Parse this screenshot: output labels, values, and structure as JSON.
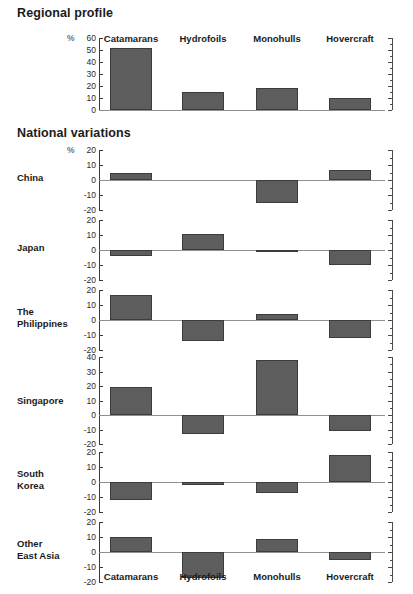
{
  "sections": {
    "regional_title": "Regional profile",
    "national_title": "National variations"
  },
  "axis": {
    "percent_symbol": "%"
  },
  "chart_data": {
    "type": "bar",
    "categories": [
      "Catamarans",
      "Hydrofoils",
      "Monohulls",
      "Hovercraft"
    ],
    "xlabel": "",
    "ylabel": "%",
    "grid": false,
    "legend": "none",
    "panels": [
      {
        "name": "Regional profile",
        "label": "",
        "ylabel": "%",
        "ylim": [
          0,
          60
        ],
        "yticks": [
          0,
          10,
          20,
          30,
          40,
          50,
          60
        ],
        "ticklabels": [
          "0",
          "10",
          "20",
          "30",
          "40",
          "50",
          "60"
        ],
        "values": [
          52,
          15,
          18,
          10
        ]
      },
      {
        "name": "China",
        "label": "China",
        "ylabel": "%",
        "ylim": [
          -20,
          20
        ],
        "yticks": [
          -20,
          -10,
          0,
          10,
          20
        ],
        "ticklabels": [
          "-20",
          "-10",
          "0",
          "10",
          "20"
        ],
        "values": [
          5,
          0,
          -15,
          7
        ]
      },
      {
        "name": "Japan",
        "label": "Japan",
        "ylabel": "",
        "ylim": [
          -20,
          20
        ],
        "yticks": [
          -20,
          -10,
          0,
          10,
          20
        ],
        "ticklabels": [
          "-20",
          "-10",
          "0",
          "10",
          "20"
        ],
        "values": [
          -4,
          11,
          -1,
          -10
        ]
      },
      {
        "name": "The Philippines",
        "label": "The\nPhilippines",
        "ylabel": "",
        "ylim": [
          -20,
          20
        ],
        "yticks": [
          -20,
          -10,
          0,
          10,
          20
        ],
        "ticklabels": [
          "-20",
          "-10",
          "0",
          "10",
          "20"
        ],
        "values": [
          17,
          -14,
          4,
          -12
        ]
      },
      {
        "name": "Singapore",
        "label": "Singapore",
        "ylabel": "",
        "ylim": [
          -20,
          40
        ],
        "yticks": [
          -20,
          -10,
          0,
          10,
          20,
          30,
          40
        ],
        "ticklabels": [
          "-20",
          "-10",
          "0",
          "10",
          "20",
          "30",
          "40"
        ],
        "values": [
          19,
          -13,
          38,
          -11
        ]
      },
      {
        "name": "South Korea",
        "label": "South\nKorea",
        "ylabel": "",
        "ylim": [
          -20,
          20
        ],
        "yticks": [
          -20,
          -10,
          0,
          10,
          20
        ],
        "ticklabels": [
          "-20",
          "-10",
          "0",
          "10",
          "20"
        ],
        "values": [
          -12,
          -2,
          -7,
          18
        ]
      },
      {
        "name": "Other East Asia",
        "label": "Other\nEast Asia",
        "ylabel": "",
        "ylim": [
          -20,
          20
        ],
        "yticks": [
          -20,
          -10,
          0,
          10,
          20
        ],
        "ticklabels": [
          "-20",
          "-10",
          "0",
          "10",
          "20"
        ],
        "values": [
          10,
          -17,
          9,
          -5
        ]
      }
    ],
    "colors": {
      "bar_fill": "#5d5d5d",
      "bar_stroke": "#3c3c3c",
      "axis": "#3a3a3a",
      "zero_line": "#909090",
      "text": "#1b1b1b"
    }
  }
}
